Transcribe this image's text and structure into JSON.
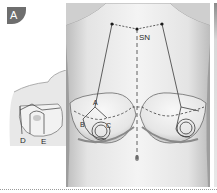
{
  "figure": {
    "panel_label": "A",
    "landmarks": {
      "sternal_notch": "SN",
      "point_a": "A",
      "point_b": "B",
      "point_c": "C",
      "point_d": "D",
      "point_e": "E"
    },
    "colors": {
      "badge": "#6e6e6e",
      "skin_light": "#f2f2f2",
      "skin_shade": "#c4c4c4",
      "line": "#3a3a3a",
      "divider": "#9a9a9a"
    }
  }
}
